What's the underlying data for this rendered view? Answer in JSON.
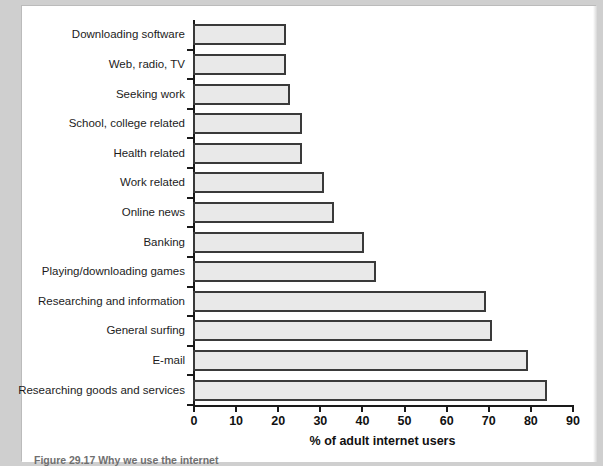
{
  "figure": {
    "caption": "Figure 29.17  Why we use the internet"
  },
  "chart_data": {
    "type": "bar",
    "orientation": "horizontal",
    "title": "",
    "xlabel": "% of adult internet users",
    "ylabel": "",
    "xlim": [
      0,
      90
    ],
    "xticks": [
      0,
      10,
      20,
      30,
      40,
      50,
      60,
      70,
      80,
      90
    ],
    "grid": false,
    "legend": null,
    "bar_fill_color": "#e9e9e9",
    "bar_edge_color": "#3a3a3a",
    "axis_color": "#1a1a1a",
    "categories": [
      "Downloading software",
      "Web, radio, TV",
      "Seeking work",
      "School, college related",
      "Health related",
      "Work related",
      "Online news",
      "Banking",
      "Playing/downloading games",
      "Researching and information",
      "General surfing",
      "E-mail",
      "Researching goods and services"
    ],
    "values": [
      22,
      22,
      23,
      26,
      26,
      31,
      33.5,
      40.5,
      43.5,
      69.5,
      71,
      79.5,
      84
    ]
  }
}
